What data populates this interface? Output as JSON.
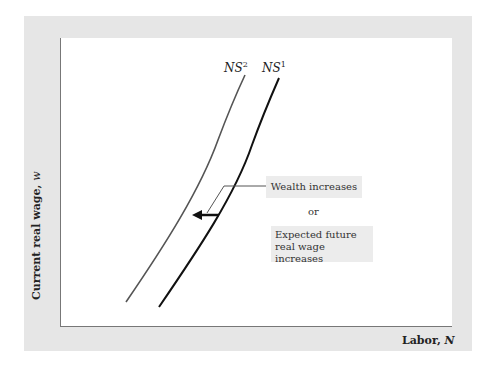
{
  "diagram": {
    "type": "labor-supply-shift",
    "y_axis_label": "Current real wage, ",
    "y_axis_var": "w",
    "x_axis_label": "Labor, ",
    "x_axis_var": "N",
    "curves": [
      {
        "name": "NS",
        "sup": "2",
        "color": "#555555",
        "description": "shifted labor supply curve (left)"
      },
      {
        "name": "NS",
        "sup": "1",
        "color": "#111111",
        "description": "initial labor supply curve"
      }
    ],
    "annotation": {
      "cause_1": "Wealth increases",
      "connector": "or",
      "cause_2_line1": "Expected future",
      "cause_2_line2": "real wage increases",
      "arrow_direction": "left"
    }
  }
}
